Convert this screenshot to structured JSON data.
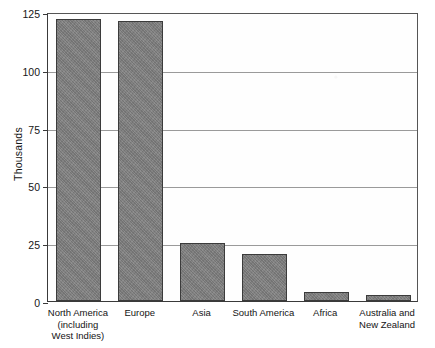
{
  "chart_data": {
    "type": "bar",
    "title": "",
    "xlabel": "",
    "ylabel": "Thousands",
    "ylim": [
      0,
      125
    ],
    "grid": true,
    "legend": "none",
    "yticks": [
      125,
      100,
      75,
      50,
      25,
      0
    ],
    "ytick_labels": [
      "125",
      "100",
      "75",
      "50",
      "25",
      "0"
    ],
    "categories": [
      "North America\n(including\nWest Indies)",
      "Europe",
      "Asia",
      "South America",
      "Africa",
      "Australia and\nNew Zealand"
    ],
    "category_labels": [
      "North America",
      "Europe",
      "Asia",
      "South America",
      "Africa",
      "Australia and"
    ],
    "values": [
      122,
      121,
      25,
      20.5,
      4,
      2.5
    ],
    "bar_color": "#7e7e7e",
    "bar_edge_color": "#3b3b3b",
    "axis_color": "#3a3a3a",
    "grid_color": "#9a9a9a",
    "background_color": "#ffffff"
  },
  "axis": {
    "y_title": "Thousands"
  },
  "ticks": {
    "t125": "125",
    "t100": "100",
    "t75": "75",
    "t50": "50",
    "t25": "25",
    "t0": "0"
  },
  "categories": {
    "c0": "North America\n(including\nWest Indies)",
    "c1": "Europe",
    "c2": "Asia",
    "c3": "South America",
    "c4": "Africa",
    "c5": "Australia and\nNew Zealand"
  }
}
